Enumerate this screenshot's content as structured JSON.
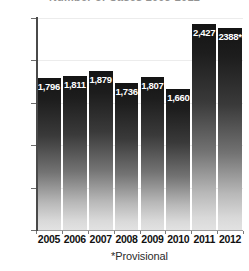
{
  "chart_data": {
    "type": "bar",
    "title": "Number of Cases 2005-2012",
    "title_clipped": true,
    "xlabel": "",
    "ylabel": "",
    "categories": [
      "2005",
      "2006",
      "2007",
      "2008",
      "2009",
      "2010",
      "2011",
      "2012"
    ],
    "values": [
      1796,
      1811,
      1879,
      1736,
      1807,
      1660,
      2427,
      2388
    ],
    "data_labels": [
      "1,796",
      "1,811",
      "1,879",
      "1,736",
      "1,807",
      "1,660",
      "2,427",
      "2388*"
    ],
    "ylim": [
      0,
      2500
    ],
    "ytick_values": [
      0,
      500,
      1000,
      1500,
      2000,
      2500
    ],
    "ytick_labels": [
      "0",
      "500",
      "1000",
      "1500",
      "2000",
      "2500"
    ],
    "grid": true,
    "grid_axis": "y",
    "legend": false,
    "annotations": [
      "*Provisional"
    ],
    "bar_color_top": "#141414",
    "bar_color_bottom": "#e2e2e2",
    "data_label_color": "#ffffff",
    "axis_color": "#4a4a4a",
    "gridline_color": "#ececec",
    "background_color": "#ffffff"
  },
  "footnote": {
    "text": "*Provisional"
  }
}
